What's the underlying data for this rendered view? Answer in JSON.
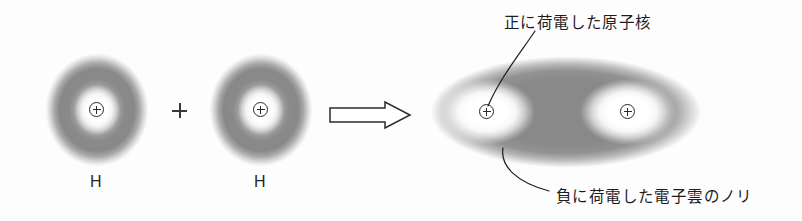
{
  "figure": {
    "caption_language": "ja",
    "reaction": "H + H → H2",
    "background_color": "#fdfdfd",
    "ink_color": "#1d1d1d",
    "cloud_color": "#8c8c8c"
  },
  "reactants": {
    "atom_1": {
      "element_label": "H",
      "nucleus_symbol": "⊕",
      "center_x": 97,
      "center_y": 110,
      "cloud_radius_x": 52,
      "cloud_radius_y": 56
    },
    "operator": {
      "symbol": "+",
      "name": "plus-sign"
    },
    "atom_2": {
      "element_label": "H",
      "nucleus_symbol": "⊕",
      "center_x": 261,
      "center_y": 110,
      "cloud_radius_x": 52,
      "cloud_radius_y": 56
    }
  },
  "arrow": {
    "name": "reaction-arrow",
    "direction": "right",
    "style": "hollow-outline"
  },
  "product": {
    "name": "hydrogen-molecule",
    "center_x": 566,
    "center_y": 112,
    "cloud_radius_x": 136,
    "cloud_radius_y": 56,
    "nuclei": [
      {
        "symbol": "⊕",
        "center_x": 487,
        "center_y": 112
      },
      {
        "symbol": "⊕",
        "center_x": 628,
        "center_y": 112
      }
    ]
  },
  "annotations": {
    "nucleus_callout": {
      "text": "正に荷電した原子核",
      "x": 504,
      "y": 10
    },
    "electron_cloud_callout": {
      "text": "負に荷電した電子雲のノリ",
      "x": 556,
      "y": 184
    }
  }
}
